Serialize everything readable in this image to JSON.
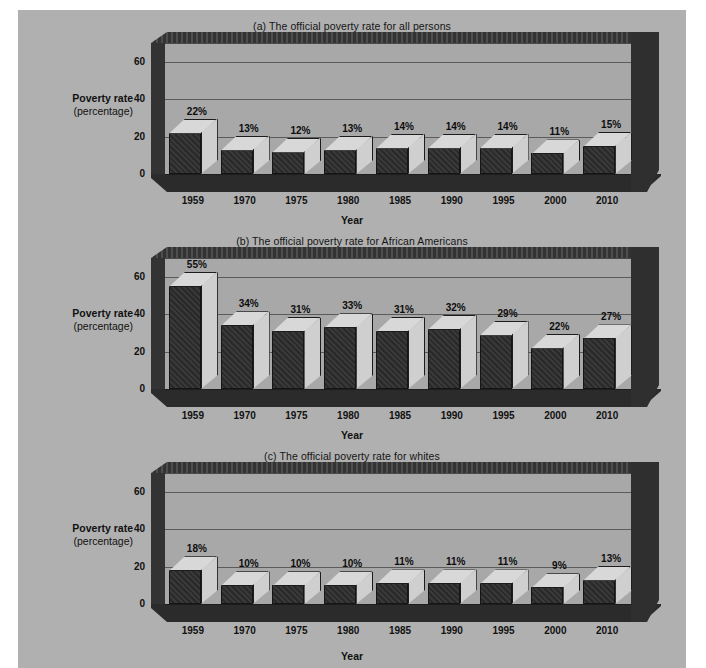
{
  "figure": {
    "background": "#b0b0b0",
    "bar_color": "#2e2e2e",
    "bar_top_color": "#d8d8d8",
    "wall_color": "#a8a8a8",
    "frame_color": "#333333"
  },
  "axis": {
    "y_title_bold": "Poverty rate",
    "y_title_sub": "(percentage)",
    "x_title": "Year",
    "y_ticks": [
      "0",
      "20",
      "40",
      "60"
    ]
  },
  "chart_data": [
    {
      "type": "bar",
      "title": "(a) The official poverty rate for all persons",
      "categories": [
        "1959",
        "1970",
        "1975",
        "1980",
        "1985",
        "1990",
        "1995",
        "2000",
        "2010"
      ],
      "values": [
        22,
        13,
        12,
        13,
        14,
        14,
        14,
        11,
        15
      ],
      "labels": [
        "22%",
        "13%",
        "12%",
        "13%",
        "14%",
        "14%",
        "14%",
        "11%",
        "15%"
      ],
      "xlabel": "Year",
      "ylabel": "Poverty rate (percentage)",
      "ylim": [
        0,
        70
      ],
      "yticks": [
        0,
        20,
        40,
        60
      ],
      "grid": true,
      "legend": "none"
    },
    {
      "type": "bar",
      "title": "(b) The official poverty rate for African Americans",
      "categories": [
        "1959",
        "1970",
        "1975",
        "1980",
        "1985",
        "1990",
        "1995",
        "2000",
        "2010"
      ],
      "values": [
        55,
        34,
        31,
        33,
        31,
        32,
        29,
        22,
        27
      ],
      "labels": [
        "55%",
        "34%",
        "31%",
        "33%",
        "31%",
        "32%",
        "29%",
        "22%",
        "27%"
      ],
      "xlabel": "Year",
      "ylabel": "Poverty rate (percentage)",
      "ylim": [
        0,
        70
      ],
      "yticks": [
        0,
        20,
        40,
        60
      ],
      "grid": true,
      "legend": "none"
    },
    {
      "type": "bar",
      "title": "(c) The official poverty rate for whites",
      "categories": [
        "1959",
        "1970",
        "1975",
        "1980",
        "1985",
        "1990",
        "1995",
        "2000",
        "2010"
      ],
      "values": [
        18,
        10,
        10,
        10,
        11,
        11,
        11,
        9,
        13
      ],
      "labels": [
        "18%",
        "10%",
        "10%",
        "10%",
        "11%",
        "11%",
        "11%",
        "9%",
        "13%"
      ],
      "xlabel": "Year",
      "ylabel": "Poverty rate (percentage)",
      "ylim": [
        0,
        70
      ],
      "yticks": [
        0,
        20,
        40,
        60
      ],
      "grid": true,
      "legend": "none"
    }
  ]
}
